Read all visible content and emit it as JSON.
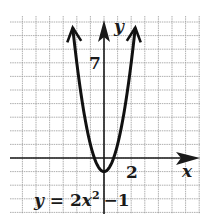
{
  "chart_data": {
    "type": "line",
    "title": "",
    "equation": "y = 2x^2 - 1",
    "equation_label": {
      "lhs": "y = 2x",
      "exp": "2",
      "rhs": "−1"
    },
    "xlabel": "x",
    "ylabel": "y",
    "tick_labels": {
      "x": "2",
      "y": "7"
    },
    "xlim": [
      -7,
      7
    ],
    "ylim": [
      -3.5,
      10.5
    ],
    "grid": true,
    "grid_step": 1,
    "series": [
      {
        "name": "y = 2x^2 - 1",
        "function": "2*x^2-1",
        "vertex": [
          0,
          -1
        ],
        "x": [
          -2.4,
          -2,
          -1.5,
          -1,
          -0.5,
          0,
          0.5,
          1,
          1.5,
          2,
          2.4
        ],
        "values": [
          10.52,
          7,
          3.5,
          1,
          -0.5,
          -1,
          -0.5,
          1,
          3.5,
          7,
          10.52
        ],
        "arrows_at_ends": true
      }
    ]
  },
  "colors": {
    "grid": "#9a9a9a",
    "axis": "#1a1a1a",
    "curve": "#111111",
    "background": "#ffffff"
  }
}
